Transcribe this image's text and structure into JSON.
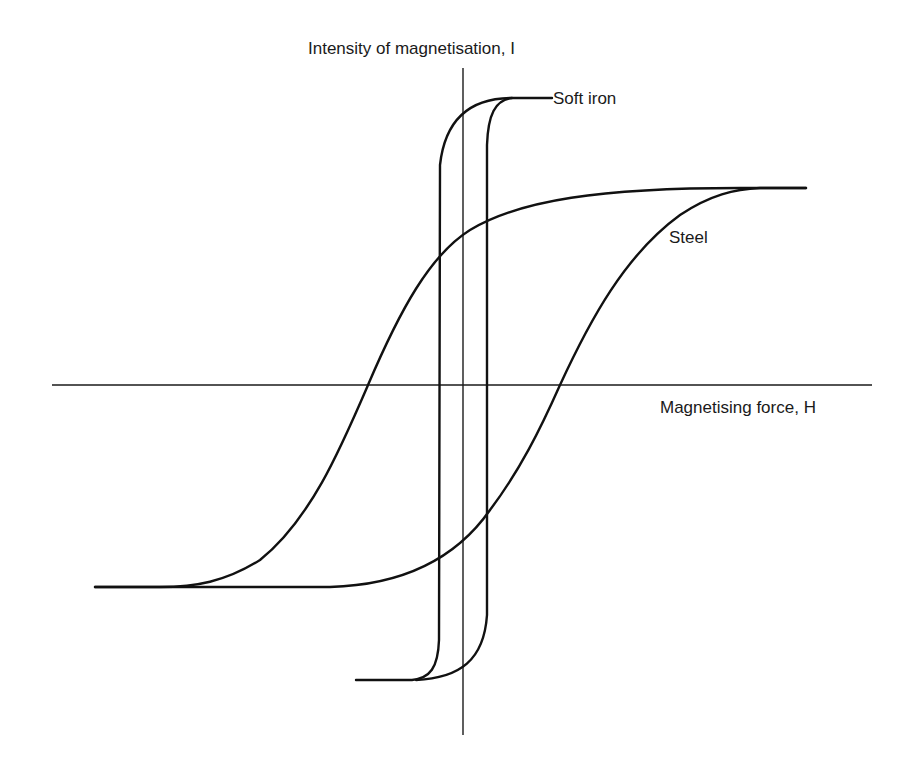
{
  "diagram": {
    "axes": {
      "y_label": "Intensity of magnetisation, I",
      "x_label": "Magnetising force, H"
    },
    "curves": [
      {
        "name": "Soft iron",
        "label": "Soft iron",
        "description": "narrow, tall hysteresis loop"
      },
      {
        "name": "Steel",
        "label": "Steel",
        "description": "wide hysteresis loop"
      }
    ],
    "colors": {
      "line": "#111111",
      "background": "#ffffff"
    }
  }
}
